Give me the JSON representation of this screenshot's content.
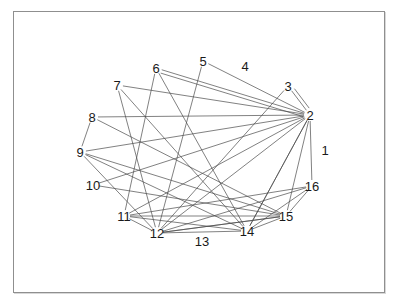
{
  "figure": {
    "type": "node-link-graph",
    "background_color": "#ffffff",
    "frame": {
      "x": 13,
      "y": 11,
      "width": 372,
      "height": 282,
      "border_color": "#8f8f8f"
    },
    "edge_color": "#4a4a4a",
    "edge_width": 0.7,
    "label_color": "#1a1a1a",
    "label_font_size": 13
  },
  "graph_data": {
    "type": "graph",
    "node_count": 16,
    "edge_count": 38,
    "nodes": [
      {
        "id": "1",
        "label": "1",
        "x": 325,
        "y": 150
      },
      {
        "id": "2",
        "label": "2",
        "x": 310,
        "y": 115
      },
      {
        "id": "3",
        "label": "3",
        "x": 288,
        "y": 86
      },
      {
        "id": "4",
        "label": "4",
        "x": 245,
        "y": 66
      },
      {
        "id": "5",
        "label": "5",
        "x": 203,
        "y": 61
      },
      {
        "id": "6",
        "label": "6",
        "x": 156,
        "y": 68
      },
      {
        "id": "7",
        "label": "7",
        "x": 117,
        "y": 85
      },
      {
        "id": "8",
        "label": "8",
        "x": 92,
        "y": 117
      },
      {
        "id": "9",
        "label": "9",
        "x": 80,
        "y": 152
      },
      {
        "id": "10",
        "label": "10",
        "x": 93,
        "y": 185
      },
      {
        "id": "11",
        "label": "11",
        "x": 124,
        "y": 216
      },
      {
        "id": "12",
        "label": "12",
        "x": 157,
        "y": 233
      },
      {
        "id": "13",
        "label": "13",
        "x": 202,
        "y": 241
      },
      {
        "id": "14",
        "label": "14",
        "x": 247,
        "y": 231
      },
      {
        "id": "15",
        "label": "15",
        "x": 286,
        "y": 216
      },
      {
        "id": "16",
        "label": "16",
        "x": 312,
        "y": 186
      }
    ],
    "edges": [
      {
        "source": "2",
        "target": "3"
      },
      {
        "source": "2",
        "target": "3",
        "variant": "second"
      },
      {
        "source": "2",
        "target": "16"
      },
      {
        "source": "2",
        "target": "15"
      },
      {
        "source": "2",
        "target": "14"
      },
      {
        "source": "2",
        "target": "12"
      },
      {
        "source": "2",
        "target": "11"
      },
      {
        "source": "2",
        "target": "10"
      },
      {
        "source": "2",
        "target": "9"
      },
      {
        "source": "2",
        "target": "8"
      },
      {
        "source": "2",
        "target": "7"
      },
      {
        "source": "2",
        "target": "6"
      },
      {
        "source": "2",
        "target": "5"
      },
      {
        "source": "5",
        "target": "12"
      },
      {
        "source": "6",
        "target": "14"
      },
      {
        "source": "6",
        "target": "2",
        "variant": "second"
      },
      {
        "source": "7",
        "target": "12"
      },
      {
        "source": "8",
        "target": "9"
      },
      {
        "source": "8",
        "target": "15"
      },
      {
        "source": "9",
        "target": "15"
      },
      {
        "source": "9",
        "target": "14"
      },
      {
        "source": "10",
        "target": "15"
      },
      {
        "source": "11",
        "target": "12"
      },
      {
        "source": "11",
        "target": "14"
      },
      {
        "source": "11",
        "target": "15"
      },
      {
        "source": "12",
        "target": "14"
      },
      {
        "source": "12",
        "target": "15"
      },
      {
        "source": "12",
        "target": "16"
      },
      {
        "source": "14",
        "target": "15"
      },
      {
        "source": "15",
        "target": "16"
      },
      {
        "source": "11",
        "target": "16"
      },
      {
        "source": "14",
        "target": "2"
      },
      {
        "source": "15",
        "target": "12"
      },
      {
        "source": "9",
        "target": "12"
      },
      {
        "source": "7",
        "target": "14"
      },
      {
        "source": "11",
        "target": "6"
      },
      {
        "source": "12",
        "target": "3"
      },
      {
        "source": "14",
        "target": "16"
      }
    ],
    "isolated_nodes": [
      "4",
      "13"
    ],
    "hub_node": "2"
  }
}
